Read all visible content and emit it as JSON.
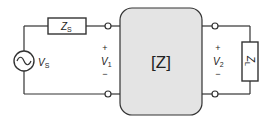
{
  "diagram": {
    "source": {
      "label_main": "V",
      "label_sub": "S",
      "symbol": "ac-source-icon"
    },
    "source_impedance": {
      "label_main": "Z",
      "label_sub": "S"
    },
    "network": {
      "label": "[Z]",
      "fill": "#e4e4e4"
    },
    "port1": {
      "plus": "+",
      "label_main": "V",
      "label_sub": "1",
      "minus": "−"
    },
    "port2": {
      "plus": "+",
      "label_main": "V",
      "label_sub": "2",
      "minus": "−"
    },
    "load": {
      "label_main": "Z",
      "label_sub": "L"
    },
    "colors": {
      "wire": "#333333",
      "box_fill": "#e4e4e4",
      "background": "#ffffff"
    }
  }
}
